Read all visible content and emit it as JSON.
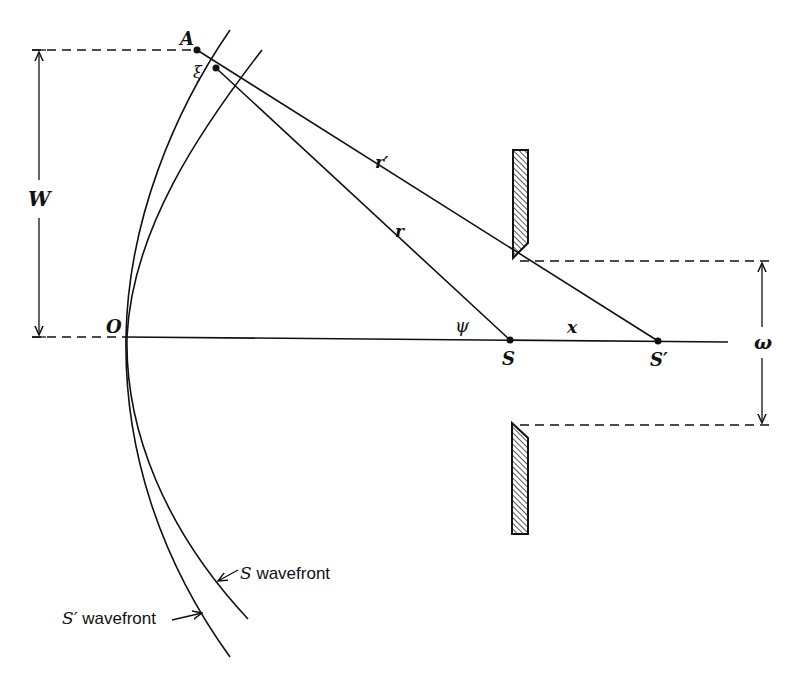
{
  "diagram": {
    "points": {
      "A": {
        "label": "A",
        "x": 197,
        "y": 50
      },
      "xi_point": {
        "label": "ξ",
        "x": 216,
        "y": 68
      },
      "O": {
        "label": "O",
        "x": 126,
        "y": 337
      },
      "S": {
        "label": "S",
        "x": 510,
        "y": 340
      },
      "S_prime": {
        "label": "S′",
        "x": 658,
        "y": 341
      }
    },
    "segments": {
      "r": {
        "label": "r"
      },
      "r_prime": {
        "label": "r′"
      },
      "x": {
        "label": "x"
      }
    },
    "angles": {
      "psi": {
        "label": "ψ"
      }
    },
    "dimensions": {
      "W": {
        "label": "W"
      },
      "omega": {
        "label": "ω"
      }
    },
    "wavefronts": {
      "S": {
        "label_symbol": "S",
        "label_text": " wavefront"
      },
      "S_prime": {
        "label_symbol": "S′",
        "label_text": " wavefront"
      }
    },
    "aperture": {
      "description": "slit with two hatched jaws"
    }
  }
}
